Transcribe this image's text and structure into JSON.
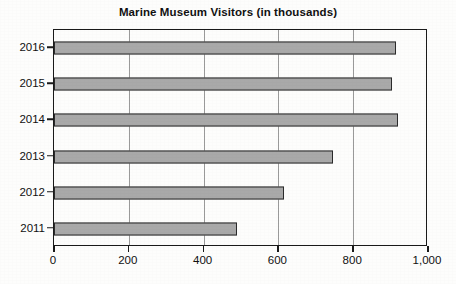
{
  "chart_data": {
    "type": "bar",
    "orientation": "horizontal",
    "title": "Marine Museum Visitors (in thousands)",
    "xlabel": "",
    "ylabel": "",
    "categories": [
      "2016",
      "2015",
      "2014",
      "2013",
      "2012",
      "2011"
    ],
    "values": [
      915,
      905,
      920,
      745,
      615,
      490
    ],
    "series": [
      {
        "name": "Visitors",
        "values": [
          915,
          905,
          920,
          745,
          615,
          490
        ]
      }
    ],
    "xlim": [
      0,
      1000
    ],
    "xticks": [
      0,
      200,
      400,
      600,
      800,
      1000
    ],
    "xtick_labels": [
      "0",
      "200",
      "400",
      "600",
      "800",
      "1,000"
    ],
    "grid": "vertical",
    "legend": "none",
    "bar_color": "#a9a9a9",
    "bar_border_color": "#2b2b2b",
    "axis_color": "#1a1a1a",
    "gridline_color": "#9a9a9a",
    "background_color": "#fdfdfc"
  }
}
